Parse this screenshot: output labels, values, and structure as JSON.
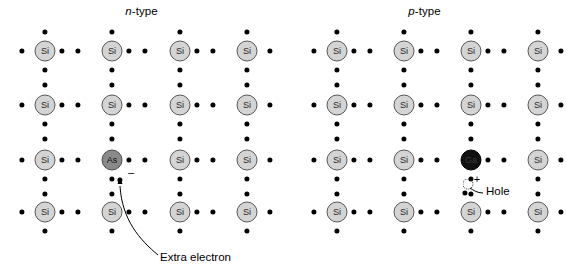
{
  "figure": {
    "kind": "semiconductor-doping-diagram",
    "background": "#ffffff"
  },
  "panels": [
    {
      "id": "n-type",
      "title_italic": "n",
      "title_rest": "-type",
      "origin_x": 0,
      "columns": [
        45,
        112,
        180,
        247
      ],
      "rows": [
        51,
        105,
        160,
        212
      ],
      "atoms": [
        {
          "label": "Si",
          "row": 0,
          "col": 0,
          "kind": "si"
        },
        {
          "label": "Si",
          "row": 0,
          "col": 1,
          "kind": "si"
        },
        {
          "label": "Si",
          "row": 0,
          "col": 2,
          "kind": "si"
        },
        {
          "label": "Si",
          "row": 0,
          "col": 3,
          "kind": "si"
        },
        {
          "label": "Si",
          "row": 1,
          "col": 0,
          "kind": "si"
        },
        {
          "label": "Si",
          "row": 1,
          "col": 1,
          "kind": "si"
        },
        {
          "label": "Si",
          "row": 1,
          "col": 2,
          "kind": "si"
        },
        {
          "label": "Si",
          "row": 1,
          "col": 3,
          "kind": "si"
        },
        {
          "label": "Si",
          "row": 2,
          "col": 0,
          "kind": "si"
        },
        {
          "label": "As",
          "row": 2,
          "col": 1,
          "kind": "dopant-n"
        },
        {
          "label": "Si",
          "row": 2,
          "col": 2,
          "kind": "si"
        },
        {
          "label": "Si",
          "row": 2,
          "col": 3,
          "kind": "si"
        },
        {
          "label": "Si",
          "row": 3,
          "col": 0,
          "kind": "si"
        },
        {
          "label": "Si",
          "row": 3,
          "col": 1,
          "kind": "si"
        },
        {
          "label": "Si",
          "row": 3,
          "col": 2,
          "kind": "si"
        },
        {
          "label": "Si",
          "row": 3,
          "col": 3,
          "kind": "si"
        }
      ],
      "annotation": {
        "label": "Extra electron",
        "label_x": 160,
        "label_y": 262,
        "charge_symbol": "–",
        "charge_x": 131,
        "charge_y": 172,
        "electron_x": 120,
        "electron_y": 180,
        "arrow_path": "M 158 255 C 140 240 122 220 120 186"
      }
    },
    {
      "id": "p-type",
      "title_italic": "p",
      "title_rest": "-type",
      "origin_x": 283,
      "columns": [
        337,
        404,
        471,
        538
      ],
      "rows": [
        51,
        105,
        160,
        212
      ],
      "atoms": [
        {
          "label": "Si",
          "row": 0,
          "col": 0,
          "kind": "si"
        },
        {
          "label": "Si",
          "row": 0,
          "col": 1,
          "kind": "si"
        },
        {
          "label": "Si",
          "row": 0,
          "col": 2,
          "kind": "si"
        },
        {
          "label": "Si",
          "row": 0,
          "col": 3,
          "kind": "si"
        },
        {
          "label": "Si",
          "row": 1,
          "col": 0,
          "kind": "si"
        },
        {
          "label": "Si",
          "row": 1,
          "col": 1,
          "kind": "si"
        },
        {
          "label": "Si",
          "row": 1,
          "col": 2,
          "kind": "si"
        },
        {
          "label": "Si",
          "row": 1,
          "col": 3,
          "kind": "si"
        },
        {
          "label": "Si",
          "row": 2,
          "col": 0,
          "kind": "si"
        },
        {
          "label": "Si",
          "row": 2,
          "col": 1,
          "kind": "si"
        },
        {
          "label": "Ga",
          "row": 2,
          "col": 2,
          "kind": "dopant-p"
        },
        {
          "label": "Si",
          "row": 2,
          "col": 3,
          "kind": "si"
        },
        {
          "label": "Si",
          "row": 3,
          "col": 0,
          "kind": "si"
        },
        {
          "label": "Si",
          "row": 3,
          "col": 1,
          "kind": "si"
        },
        {
          "label": "Si",
          "row": 3,
          "col": 2,
          "kind": "si"
        },
        {
          "label": "Si",
          "row": 3,
          "col": 3,
          "kind": "si"
        }
      ],
      "annotation": {
        "label": "Hole",
        "label_x": 486,
        "label_y": 196,
        "charge_symbol": "+",
        "charge_x": 477,
        "charge_y": 179,
        "hole_x": 468,
        "hole_y": 184,
        "leader_path": "M 483 193 C 477 193 473 190 470 188"
      }
    }
  ],
  "bonds": {
    "note": "Electron dot pairs lie between neighbouring atoms on each lattice link.",
    "dot_color": "#000000"
  }
}
